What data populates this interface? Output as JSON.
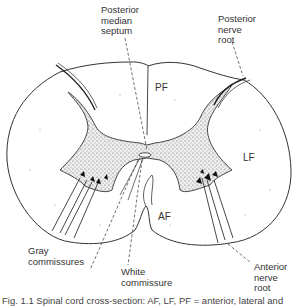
{
  "figure": {
    "title": "Spinal cord cross-section",
    "labels": {
      "posterior_median_septum": "Posterior\nmedian\nseptum",
      "posterior_nerve_root": "Posterior\nnerve\nroot",
      "gray_commissures": "Gray\ncommissures",
      "white_commissure": "White\ncommissure",
      "anterior_nerve_root": "Anterior\nnerve\nroot"
    },
    "regions": {
      "posterior_funiculus": "PF",
      "lateral_funiculus": "LF",
      "anterior_funiculus": "AF"
    },
    "caption": "Fig. 1.1   Spinal cord cross-section: AF, LF, PF = anterior, lateral and"
  }
}
